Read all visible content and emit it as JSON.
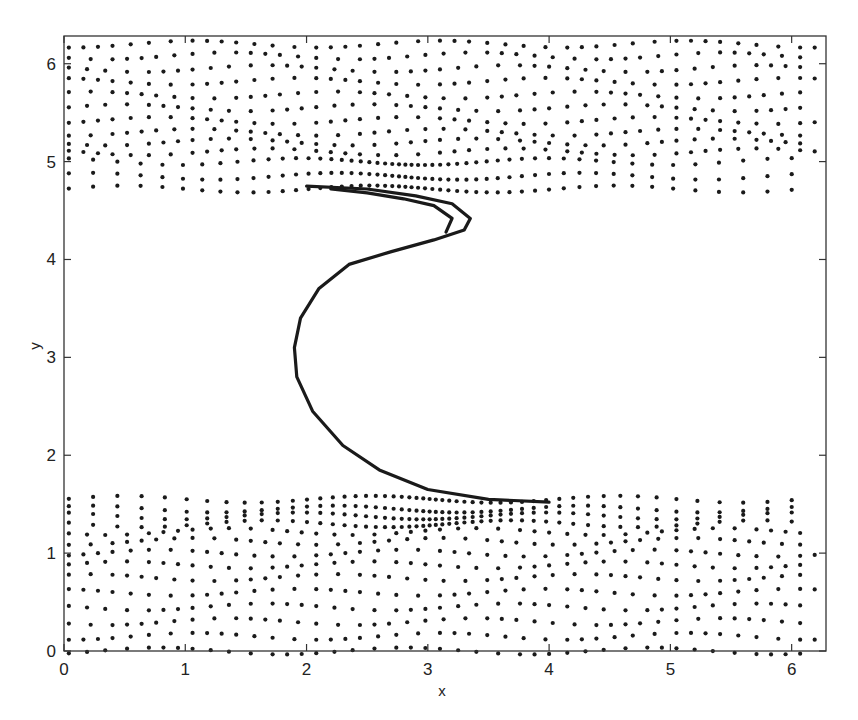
{
  "chart_data": {
    "type": "scatter",
    "title": "",
    "xlabel": "x",
    "ylabel": "y",
    "xlim": [
      0,
      6.2832
    ],
    "ylim": [
      0,
      6.2832
    ],
    "xticks": [
      0,
      1,
      2,
      3,
      4,
      5,
      6
    ],
    "yticks": [
      0,
      1,
      2,
      3,
      4,
      5,
      6
    ],
    "xtick_labels": [
      "0",
      "1",
      "2",
      "3",
      "4",
      "5",
      "6"
    ],
    "ytick_labels": [
      "0",
      "1",
      "2",
      "3",
      "4",
      "5",
      "6"
    ],
    "grid": false,
    "legend": null,
    "marker_color": "#1a1a1a",
    "series": [
      {
        "name": "lower band rows",
        "y_levels": [
          1.55,
          1.45,
          1.38,
          1.3,
          1.22,
          1.12,
          1.0,
          0.88,
          0.75,
          0.6,
          0.45,
          0.3,
          0.15,
          0.0
        ],
        "x_range": [
          0,
          6.2
        ]
      },
      {
        "name": "upper band rows",
        "y_levels": [
          4.72,
          4.85,
          5.0,
          5.1,
          5.2,
          5.3,
          5.42,
          5.55,
          5.68,
          5.82,
          5.95,
          6.08,
          6.2
        ],
        "x_range": [
          0,
          6.2
        ]
      },
      {
        "name": "S-curve (outer)",
        "x": [
          4.0,
          3.5,
          3.0,
          2.6,
          2.3,
          2.05,
          1.92,
          1.9,
          1.95,
          2.1,
          2.35,
          2.7,
          3.05,
          3.3,
          3.35,
          3.2,
          2.9,
          2.5,
          2.0
        ],
        "y": [
          1.52,
          1.55,
          1.65,
          1.85,
          2.1,
          2.45,
          2.8,
          3.1,
          3.4,
          3.7,
          3.95,
          4.08,
          4.2,
          4.3,
          4.42,
          4.57,
          4.65,
          4.72,
          4.75
        ]
      },
      {
        "name": "S-curve (inner)",
        "x": [
          3.15,
          3.2,
          3.05,
          2.8,
          2.5,
          2.2
        ],
        "y": [
          4.28,
          4.42,
          4.55,
          4.62,
          4.68,
          4.72
        ]
      }
    ]
  }
}
